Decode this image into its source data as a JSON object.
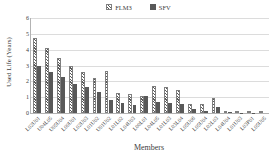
{
  "chart_data": {
    "type": "bar",
    "title": "",
    "xlabel": "Members",
    "ylabel": "Used Life (Years)",
    "ylim": [
      0,
      6
    ],
    "y_ticks": [
      0,
      1,
      2,
      3,
      4,
      5,
      6
    ],
    "grid": true,
    "legend_position": "top",
    "categories": [
      "L02U01",
      "U04L05",
      "U05U04",
      "L00U01",
      "L02U03",
      "L01U02",
      "U01U02",
      "L01L02",
      "L04U03",
      "L00L01",
      "L04L05",
      "L01L03",
      "L03L04",
      "L05U06",
      "L05U04",
      "L02L03",
      "L04U04",
      "L01U03",
      "L03P01",
      "L05U05"
    ],
    "series": [
      {
        "name": "FLM3",
        "pattern": "hatch",
        "values": [
          4.75,
          4.1,
          3.5,
          2.95,
          2.6,
          2.2,
          2.65,
          1.25,
          1.2,
          1.1,
          1.7,
          1.65,
          1.45,
          0.6,
          0.55,
          0.95,
          0.15,
          0.08,
          0.03,
          0.02
        ]
      },
      {
        "name": "SFV",
        "pattern": "solid",
        "values": [
          3.0,
          2.6,
          2.25,
          1.85,
          1.65,
          1.3,
          0.8,
          0.65,
          0.5,
          1.1,
          0.7,
          0.65,
          0.6,
          0.25,
          0.15,
          0.4,
          0.05,
          0.02,
          0.01,
          0.0
        ]
      }
    ],
    "colors": {
      "hatch_stripe": "#595959",
      "solid_fill": "#595959",
      "gridline": "#dcdcdc",
      "axis_line": "#b3b3b3",
      "text": "#404040"
    }
  }
}
